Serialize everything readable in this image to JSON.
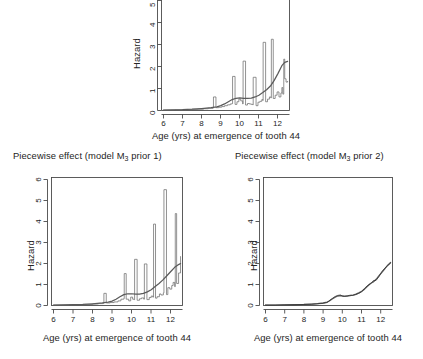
{
  "figure": {
    "background": "#ffffff",
    "line_color": "#5a5a5a",
    "step_color": "#6e6e6e",
    "axis_color": "#4a4a4a"
  },
  "common": {
    "xlabel": "Age (yrs) at emergence of tooth 44",
    "ylabel": "Hazard"
  },
  "chart_data": [
    {
      "id": "top-panel",
      "type": "line",
      "title": "",
      "xlabel": "Age (yrs) at emergence of tooth 44",
      "ylabel": "Hazard",
      "xlim": [
        5.9,
        12.6
      ],
      "ylim": [
        0,
        5.4
      ],
      "xticks": [
        6,
        7,
        8,
        9,
        10,
        11,
        12
      ],
      "yticks": [
        0,
        1,
        2,
        3,
        4,
        5
      ],
      "grid": false,
      "legend": "none",
      "note": "y-axis cropped at top of image; curve rises above 5",
      "series": [
        {
          "name": "piecewise-constant hazard (step)",
          "style": "step",
          "x": [
            6.0,
            6.3,
            6.6,
            6.9,
            7.2,
            7.5,
            7.8,
            8.1,
            8.35,
            8.6,
            8.62,
            8.75,
            8.9,
            9.05,
            9.2,
            9.35,
            9.5,
            9.6,
            9.62,
            9.75,
            9.85,
            9.95,
            10.05,
            10.15,
            10.17,
            10.3,
            10.4,
            10.5,
            10.6,
            10.68,
            10.7,
            10.85,
            10.95,
            11.05,
            11.15,
            11.2,
            11.22,
            11.35,
            11.45,
            11.55,
            11.62,
            11.65,
            11.75,
            11.85,
            11.95,
            12.05,
            12.15,
            12.2,
            12.25,
            12.3,
            12.35,
            12.42,
            12.5
          ],
          "y": [
            0.02,
            0.02,
            0.03,
            0.03,
            0.04,
            0.05,
            0.06,
            0.08,
            0.1,
            0.12,
            0.62,
            0.13,
            0.15,
            0.18,
            0.22,
            0.26,
            0.3,
            0.32,
            1.56,
            0.28,
            0.4,
            0.52,
            0.44,
            0.3,
            2.26,
            0.25,
            0.32,
            0.3,
            0.28,
            0.26,
            1.52,
            0.22,
            0.38,
            0.42,
            0.5,
            0.46,
            3.12,
            0.4,
            0.52,
            0.62,
            0.58,
            3.26,
            0.55,
            0.7,
            0.85,
            0.62,
            0.8,
            1.05,
            0.75,
            2.35,
            1.45,
            1.3,
            1.35
          ]
        },
        {
          "name": "smooth hazard estimate",
          "style": "smooth",
          "x": [
            6.0,
            6.5,
            7.0,
            7.5,
            8.0,
            8.5,
            8.8,
            9.0,
            9.2,
            9.4,
            9.6,
            9.8,
            10.0,
            10.2,
            10.4,
            10.6,
            10.8,
            11.0,
            11.2,
            11.4,
            11.6,
            11.8,
            12.0,
            12.2,
            12.35,
            12.5
          ],
          "y": [
            0.02,
            0.03,
            0.04,
            0.06,
            0.09,
            0.13,
            0.17,
            0.22,
            0.3,
            0.4,
            0.5,
            0.56,
            0.58,
            0.56,
            0.55,
            0.57,
            0.62,
            0.7,
            0.82,
            0.95,
            1.12,
            1.38,
            1.7,
            2.05,
            2.2,
            2.25
          ]
        }
      ]
    },
    {
      "id": "bottom-left-panel",
      "type": "line",
      "title": "Piecewise effect (model M3 prior 1)",
      "title_parts": {
        "prefix": "Piecewise effect (model M",
        "sub": "3",
        "suffix": " prior 1)"
      },
      "xlabel": "Age (yrs) at emergence of tooth 44",
      "ylabel": "Hazard",
      "xlim": [
        5.9,
        12.6
      ],
      "ylim": [
        0,
        6.3
      ],
      "xticks": [
        6,
        7,
        8,
        9,
        10,
        11,
        12
      ],
      "yticks": [
        0,
        1,
        2,
        3,
        4,
        5,
        6
      ],
      "grid": false,
      "legend": "none",
      "series": [
        {
          "name": "piecewise-constant hazard (step)",
          "style": "step",
          "x": [
            6.0,
            6.4,
            6.8,
            7.2,
            7.6,
            8.0,
            8.3,
            8.55,
            8.58,
            8.7,
            8.9,
            9.1,
            9.3,
            9.45,
            9.6,
            9.62,
            9.72,
            9.85,
            9.95,
            10.05,
            10.12,
            10.15,
            10.28,
            10.4,
            10.5,
            10.62,
            10.65,
            10.78,
            10.9,
            11.0,
            11.08,
            11.12,
            11.22,
            11.3,
            11.42,
            11.5,
            11.62,
            11.65,
            11.78,
            11.85,
            11.95,
            12.05,
            12.12,
            12.2,
            12.23,
            12.3,
            12.4,
            12.5
          ],
          "y": [
            0.02,
            0.02,
            0.03,
            0.04,
            0.05,
            0.07,
            0.09,
            0.11,
            0.58,
            0.12,
            0.14,
            0.17,
            0.22,
            0.3,
            0.33,
            1.52,
            0.3,
            0.22,
            0.4,
            0.3,
            0.28,
            2.2,
            0.25,
            0.32,
            0.36,
            0.3,
            1.98,
            0.28,
            0.38,
            0.45,
            0.4,
            3.88,
            0.35,
            0.42,
            0.55,
            0.5,
            0.6,
            5.52,
            0.52,
            0.85,
            0.78,
            0.95,
            1.1,
            0.9,
            4.38,
            1.05,
            1.55,
            2.35
          ]
        },
        {
          "name": "smooth hazard estimate",
          "style": "smooth",
          "x": [
            6.0,
            6.5,
            7.0,
            7.5,
            8.0,
            8.5,
            8.8,
            9.0,
            9.2,
            9.4,
            9.6,
            9.8,
            10.0,
            10.2,
            10.4,
            10.6,
            10.8,
            11.0,
            11.2,
            11.4,
            11.6,
            11.8,
            12.0,
            12.2,
            12.4,
            12.5
          ],
          "y": [
            0.02,
            0.03,
            0.04,
            0.05,
            0.08,
            0.12,
            0.16,
            0.21,
            0.3,
            0.42,
            0.52,
            0.56,
            0.56,
            0.54,
            0.54,
            0.58,
            0.65,
            0.75,
            0.9,
            1.05,
            1.22,
            1.42,
            1.62,
            1.82,
            1.95,
            2.0
          ]
        }
      ]
    },
    {
      "id": "bottom-right-panel",
      "type": "line",
      "title": "Piecewise effect (model M3 prior 2)",
      "title_parts": {
        "prefix": "Piecewise effect (model M",
        "sub": "3",
        "suffix": " prior 2)"
      },
      "xlabel": "Age (yrs) at emergence of tooth 44",
      "ylabel": "Hazard",
      "xlim": [
        5.9,
        12.6
      ],
      "ylim": [
        0,
        6.3
      ],
      "xticks": [
        6,
        7,
        8,
        9,
        10,
        11,
        12
      ],
      "yticks": [
        0,
        1,
        2,
        3,
        4,
        5,
        6
      ],
      "grid": false,
      "legend": "none",
      "series": [
        {
          "name": "posterior mean hazard",
          "style": "smooth",
          "x": [
            6.0,
            6.5,
            7.0,
            7.5,
            8.0,
            8.4,
            8.7,
            9.0,
            9.2,
            9.3,
            9.45,
            9.6,
            9.75,
            9.9,
            10.0,
            10.1,
            10.25,
            10.4,
            10.55,
            10.7,
            10.85,
            11.0,
            11.15,
            11.3,
            11.45,
            11.6,
            11.75,
            11.9,
            12.05,
            12.2,
            12.35,
            12.5
          ],
          "y": [
            0.02,
            0.02,
            0.03,
            0.04,
            0.05,
            0.07,
            0.09,
            0.12,
            0.16,
            0.2,
            0.3,
            0.38,
            0.45,
            0.47,
            0.46,
            0.45,
            0.45,
            0.47,
            0.5,
            0.54,
            0.6,
            0.68,
            0.78,
            0.92,
            1.05,
            1.12,
            1.25,
            1.42,
            1.58,
            1.75,
            1.92,
            2.05
          ]
        },
        {
          "name": "piecewise hazard estimate",
          "style": "smooth-2",
          "x": [
            6.0,
            6.5,
            7.0,
            7.5,
            8.0,
            8.4,
            8.7,
            9.0,
            9.2,
            9.3,
            9.45,
            9.6,
            9.75,
            9.9,
            10.0,
            10.1,
            10.25,
            10.4,
            10.55,
            10.7,
            10.85,
            11.0,
            11.15,
            11.3,
            11.45,
            11.6,
            11.75,
            11.9,
            12.05,
            12.2,
            12.35,
            12.5
          ],
          "y": [
            0.02,
            0.02,
            0.03,
            0.03,
            0.05,
            0.06,
            0.08,
            0.1,
            0.14,
            0.22,
            0.32,
            0.42,
            0.48,
            0.5,
            0.44,
            0.43,
            0.46,
            0.49,
            0.48,
            0.52,
            0.58,
            0.65,
            0.82,
            0.95,
            1.02,
            1.18,
            1.2,
            1.38,
            1.62,
            1.78,
            1.9,
            2.02
          ]
        }
      ]
    }
  ]
}
